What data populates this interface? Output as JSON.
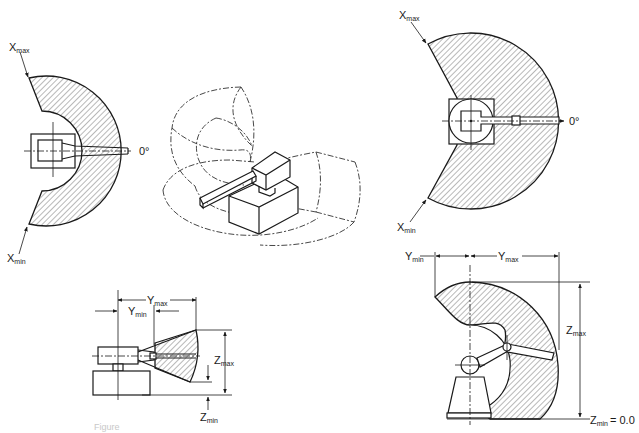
{
  "figure": {
    "caption_fragment": "Figure"
  },
  "views": {
    "top_left": {
      "label_max": "X",
      "label_max_sub": "max",
      "label_min": "X",
      "label_min_sub": "min",
      "angle_label": "0°"
    },
    "isometric": {
      "description": "Isometric view of robot arm with dashed work envelope"
    },
    "top_right": {
      "label_max": "X",
      "label_max_sub": "max",
      "label_min": "X",
      "label_min_sub": "min",
      "angle_label": "0°"
    },
    "side_left": {
      "y_max": "Y",
      "y_max_sub": "max",
      "y_min": "Y",
      "y_min_sub": "min",
      "z_max": "Z",
      "z_max_sub": "max",
      "z_min": "Z",
      "z_min_sub": "min"
    },
    "side_right": {
      "y_max": "Y",
      "y_max_sub": "max",
      "y_min": "Y",
      "y_min_sub": "min",
      "z_max": "Z",
      "z_max_sub": "max",
      "z_min": "Z",
      "z_min_sub": "min",
      "z_min_value": "= 0.0"
    }
  },
  "colors": {
    "ink": "#1a1a1a",
    "background": "#ffffff",
    "caption": "#c8c8c8"
  }
}
